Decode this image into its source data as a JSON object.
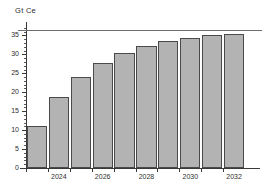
{
  "chart_data": {
    "type": "bar",
    "title": "",
    "subtitle": "",
    "xlabel": "",
    "ylabel": "Gt Ce",
    "categories": [
      2023,
      2024,
      2025,
      2026,
      2027,
      2028,
      2029,
      2030,
      2031,
      2032
    ],
    "values": [
      11.0,
      18.7,
      24.1,
      27.8,
      30.5,
      32.2,
      33.5,
      34.3,
      35.0,
      35.4
    ],
    "x": [
      2023,
      2024,
      2025,
      2026,
      2027,
      2028,
      2029,
      2030,
      2031,
      2032
    ],
    "xlim": [
      2022.5,
      2033.0
    ],
    "ylim": [
      0,
      37.5
    ],
    "ytick_labels": [
      "0",
      "5",
      "10",
      "15",
      "20",
      "25",
      "30",
      "35"
    ],
    "ytick_values": [
      0,
      5,
      10,
      15,
      20,
      25,
      30,
      35
    ],
    "ytick_minor_step": 1,
    "xtick_labels": [
      "2024",
      "2026",
      "2028",
      "2030",
      "2032"
    ],
    "xtick_values": [
      2024,
      2026,
      2028,
      2030,
      2032
    ],
    "grid": false,
    "legend": null,
    "annotations": [
      {
        "name": "reference-line",
        "type": "hline",
        "value": 36.4,
        "label": ""
      }
    ],
    "colors": {
      "bar_fill": "#b3b3b3",
      "bar_edge": "#4a4a49",
      "axis": "#3a3a39",
      "text": "#2e2e2d",
      "reference_line": "#6e6e6d",
      "background": "#ffffff"
    }
  }
}
